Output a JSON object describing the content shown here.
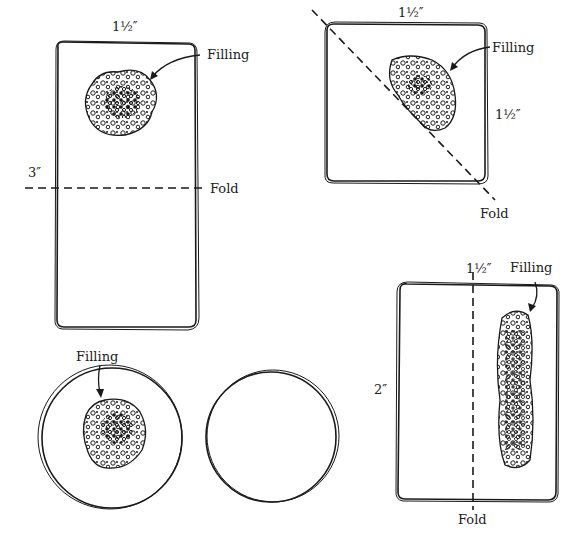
{
  "figure": {
    "ink_color": "#1a1a1a",
    "background": "#ffffff",
    "panels": [
      {
        "id": "rectangle-fold-crosswise",
        "shape": "rectangle",
        "labels": {
          "width": "1½″",
          "height": "3″",
          "filling": "Filling",
          "fold": "Fold"
        },
        "fold_line": "horizontal"
      },
      {
        "id": "square-fold-diagonal",
        "shape": "square",
        "labels": {
          "width": "1½″",
          "height": "1½″",
          "filling": "Filling",
          "fold": "Fold"
        },
        "fold_line": "diagonal"
      },
      {
        "id": "rectangle-fold-lengthwise",
        "shape": "rectangle",
        "labels": {
          "width": "1½″",
          "height": "2″",
          "filling": "Filling",
          "fold": "Fold"
        },
        "fold_line": "vertical"
      },
      {
        "id": "circle-with-filling",
        "shape": "circle",
        "labels": {
          "filling": "Filling"
        }
      },
      {
        "id": "circle-top",
        "shape": "circle",
        "labels": {}
      }
    ]
  }
}
